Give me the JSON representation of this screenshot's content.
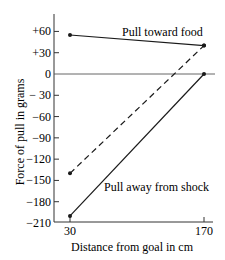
{
  "chart_data": {
    "type": "line",
    "title": "",
    "xlabel": "Distance from goal in cm",
    "ylabel": "Force of pull in grams",
    "x": [
      30,
      170
    ],
    "xlim": [
      30,
      170
    ],
    "ylim": [
      -210,
      60
    ],
    "grid": false,
    "x_ticks": [
      "30",
      "170"
    ],
    "y_ticks": [
      "+60",
      "+30",
      "0",
      "− 30",
      "−60",
      "−90",
      "−120",
      "−150",
      "−180",
      "−210"
    ],
    "y_tick_values": [
      60,
      30,
      0,
      -30,
      -60,
      -90,
      -120,
      -150,
      -180,
      -210
    ],
    "series": [
      {
        "name": "Pull toward food",
        "style": "solid",
        "values": [
          55,
          40
        ]
      },
      {
        "name": "Net pull",
        "style": "dashed",
        "values": [
          -140,
          40
        ]
      },
      {
        "name": "Pull away from shock",
        "style": "solid",
        "values": [
          -200,
          0
        ]
      }
    ],
    "annotations": [
      "Pull toward food",
      "Pull away from shock"
    ],
    "line_color": "#1a1a1a"
  }
}
